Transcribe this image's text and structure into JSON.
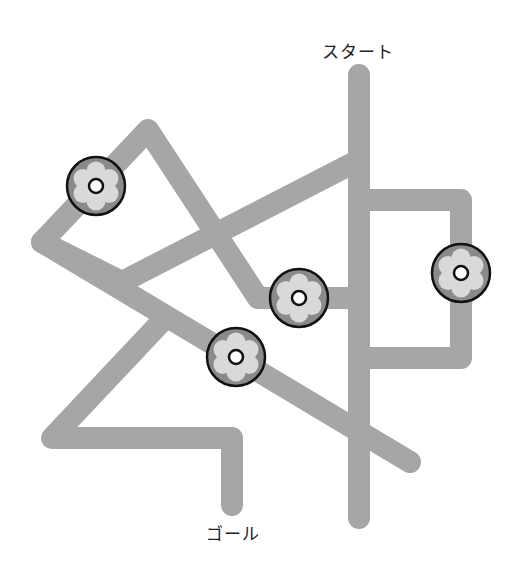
{
  "labels": {
    "start": "スタート",
    "goal": "ゴール"
  },
  "colors": {
    "path": "#a6a6a6",
    "flower_disk": "#8a8a8a",
    "flower_petal": "#d9d9d9",
    "flower_outline": "#111111",
    "flower_center": "#ffffff"
  },
  "paths": [
    {
      "name": "start-vertical",
      "points": [
        [
          359,
          75
        ],
        [
          359,
          518
        ]
      ]
    },
    {
      "name": "right-loop",
      "points": [
        [
          359,
          200
        ],
        [
          461,
          200
        ],
        [
          461,
          358
        ],
        [
          359,
          358
        ]
      ]
    },
    {
      "name": "top-left-zigzag",
      "points": [
        [
          359,
          160
        ],
        [
          122,
          282
        ],
        [
          42,
          242
        ],
        [
          148,
          130
        ],
        [
          258,
          298
        ],
        [
          359,
          298
        ]
      ]
    },
    {
      "name": "long-diagonal",
      "points": [
        [
          42,
          242
        ],
        [
          410,
          462
        ]
      ]
    },
    {
      "name": "goal-path",
      "points": [
        [
          165,
          318
        ],
        [
          52,
          438
        ],
        [
          232,
          438
        ],
        [
          232,
          505
        ]
      ]
    }
  ],
  "flowers": [
    {
      "name": "flower-1",
      "cx": 96,
      "cy": 186
    },
    {
      "name": "flower-2",
      "cx": 299,
      "cy": 298
    },
    {
      "name": "flower-3",
      "cx": 236,
      "cy": 357
    },
    {
      "name": "flower-4",
      "cx": 461,
      "cy": 273
    }
  ]
}
